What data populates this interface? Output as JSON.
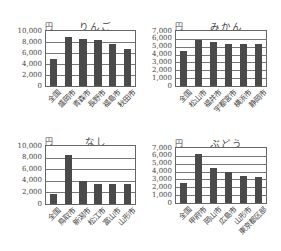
{
  "chart_data": [
    {
      "type": "bar",
      "title": "りんご",
      "ylabel": "円",
      "xlabel": "",
      "ylim": [
        0,
        10000
      ],
      "yticks": [
        "0",
        "2,000",
        "4,000",
        "6,000",
        "8,000",
        "10,000"
      ],
      "grid": true,
      "categories": [
        "全国",
        "盛岡市",
        "青森市",
        "長野市",
        "福島市",
        "秋田市"
      ],
      "values": [
        5000,
        8900,
        8600,
        8350,
        7600,
        6750
      ]
    },
    {
      "type": "bar",
      "title": "みかん",
      "ylabel": "円",
      "xlabel": "",
      "ylim": [
        0,
        7000
      ],
      "yticks": [
        "0",
        "1,000",
        "2,000",
        "3,000",
        "4,000",
        "5,000",
        "6,000",
        "7,000"
      ],
      "grid": true,
      "categories": [
        "全国",
        "松山市",
        "福井市",
        "宇都宮市",
        "横浜市",
        "静岡市"
      ],
      "values": [
        4400,
        5900,
        5600,
        5300,
        5300,
        5300
      ]
    },
    {
      "type": "bar",
      "title": "なし",
      "ylabel": "円",
      "xlabel": "",
      "ylim": [
        0,
        10000
      ],
      "yticks": [
        "0",
        "2,000",
        "4,000",
        "6,000",
        "8,000",
        "10,000"
      ],
      "grid": true,
      "categories": [
        "全国",
        "鳥取市",
        "新潟市",
        "松江市",
        "富山市",
        "山形市"
      ],
      "values": [
        1700,
        8400,
        4000,
        3500,
        3400,
        3400
      ]
    },
    {
      "type": "bar",
      "title": "ぶどう",
      "ylabel": "円",
      "xlabel": "",
      "ylim": [
        0,
        7000
      ],
      "yticks": [
        "0",
        "1,000",
        "2,000",
        "3,000",
        "4,000",
        "5,000",
        "6,000",
        "7,000"
      ],
      "grid": true,
      "categories": [
        "全国",
        "甲府市",
        "岡山市",
        "広島市",
        "山形市",
        "東京都区部"
      ],
      "values": [
        2600,
        6300,
        4500,
        3900,
        3400,
        3250
      ]
    }
  ],
  "colors": {
    "bar": "#4a4a4a",
    "grid": "#777777",
    "text": "#444444"
  }
}
